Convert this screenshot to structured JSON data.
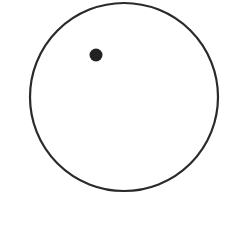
{
  "diagram": {
    "background": "#ffffff",
    "circle": {
      "cx": 124,
      "cy": 97,
      "r": 94,
      "stroke": "#2a2a2a",
      "stroke_width": 2.2,
      "fill": "none"
    },
    "dot": {
      "cx": 96,
      "cy": 55,
      "r": 6.5,
      "fill": "#222222"
    }
  }
}
